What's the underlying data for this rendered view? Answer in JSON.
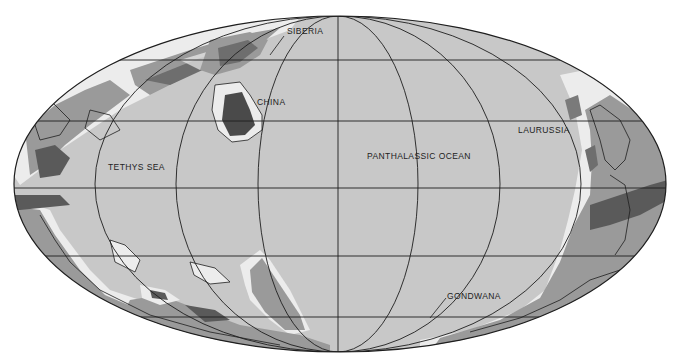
{
  "map": {
    "projection": "Mollweide (oval equal-area)",
    "colors": {
      "background": "#ffffff",
      "ocean": "#c8c8c8",
      "shelf": "#ececec",
      "lowland": "#9a9a9a",
      "highland": "#6e6e6e",
      "mountain": "#4a4a4a",
      "grid": "#1e1e1e",
      "outline": "#1e1e1e"
    },
    "labels": [
      {
        "id": "siberia",
        "text": "SIBERIA",
        "x": 287,
        "y": 31
      },
      {
        "id": "china",
        "text": "CHINA",
        "x": 257,
        "y": 100
      },
      {
        "id": "tethys-sea",
        "text": "TETHYS SEA",
        "x": 108,
        "y": 164
      },
      {
        "id": "panthalassic-ocean",
        "text": "PANTHALASSIC OCEAN",
        "x": 367,
        "y": 153
      },
      {
        "id": "laurussia",
        "text": "LAURUSSIA",
        "x": 518,
        "y": 127
      },
      {
        "id": "gondwana",
        "text": "GONDWANA",
        "x": 447,
        "y": 292
      }
    ]
  }
}
